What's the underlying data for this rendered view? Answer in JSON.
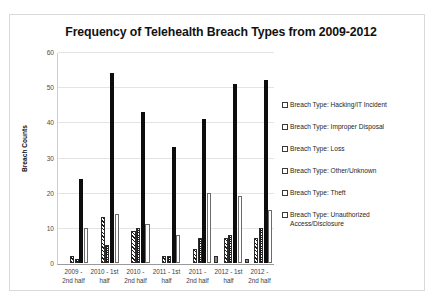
{
  "chart_data": {
    "type": "bar",
    "title": "Frequency of Telehealth Breach Types from 2009-2012",
    "xlabel": "",
    "ylabel": "Breach Counts",
    "ylim": [
      0,
      60
    ],
    "yticks": [
      0,
      10,
      20,
      30,
      40,
      50,
      60
    ],
    "grid": true,
    "legend_position": "right",
    "categories": [
      "2009 - 2nd half",
      "2010 - 1st half",
      "2010 - 2nd half",
      "2011 - 1st half",
      "2011 - 2nd half",
      "2012 - 1st half",
      "2012 - 2nd half"
    ],
    "category_lines": [
      [
        "2009 -",
        "2nd half"
      ],
      [
        "2010 - 1st",
        "half"
      ],
      [
        "2010 -",
        "2nd half"
      ],
      [
        "2011 - 1st",
        "half"
      ],
      [
        "2011 -",
        "2nd half"
      ],
      [
        "2012 - 1st",
        "half"
      ],
      [
        "2012 -",
        "2nd half"
      ]
    ],
    "series": [
      {
        "name": "Breach Type: Hacking/IT Incident",
        "pattern": "solid-gray",
        "values": [
          0,
          0,
          0,
          0,
          0,
          2,
          1
        ]
      },
      {
        "name": "Breach Type: Improper Disposal",
        "pattern": "white",
        "values": [
          0,
          0,
          0,
          0,
          0,
          0,
          0
        ]
      },
      {
        "name": "Breach Type: Loss",
        "pattern": "diagonal-hatch",
        "values": [
          2,
          13,
          9,
          2,
          4,
          7,
          7
        ]
      },
      {
        "name": "Breach Type: Other/Unknown",
        "pattern": "cross-hatch",
        "values": [
          1,
          5,
          10,
          2,
          7,
          8,
          10
        ]
      },
      {
        "name": "Breach Type: Theft",
        "pattern": "solid-black",
        "values": [
          24,
          54,
          43,
          33,
          41,
          51,
          52
        ]
      },
      {
        "name": "Breach Type: Unauthorized Access/Disclosure",
        "pattern": "white-outline",
        "values": [
          10,
          14,
          11,
          8,
          20,
          19,
          15
        ]
      }
    ]
  },
  "legend": {
    "items": [
      {
        "label": "Breach Type: Hacking/IT Incident",
        "swatch": "solid-gray"
      },
      {
        "label": "Breach Type: Improper Disposal",
        "swatch": "white"
      },
      {
        "label": "Breach Type: Loss",
        "swatch": "diagonal-hatch"
      },
      {
        "label": "Breach Type: Other/Unknown",
        "swatch": "cross-hatch"
      },
      {
        "label": "Breach Type: Theft",
        "swatch": "solid-black"
      },
      {
        "label": "Breach Type: Unauthorized Access/Disclosure",
        "swatch": "white-outline"
      }
    ]
  },
  "colors": {
    "frame_border": "#d9d9d9",
    "gridline": "#e4e4e4",
    "axis": "#9a9a9a",
    "text": "#262626",
    "theft_fill": "#0d0d0d",
    "hacking_fill": "#8a8a8a"
  }
}
